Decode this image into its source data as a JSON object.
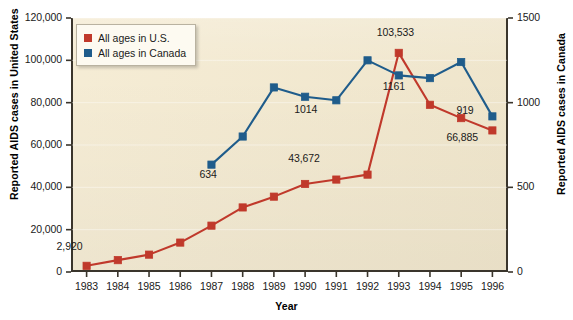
{
  "chart_data": {
    "type": "line",
    "title": "",
    "xlabel": "Year",
    "ylabel": "Reported AIDS cases in United States",
    "ylabel_right": "Reported AIDS cases in Canada",
    "categories": [
      "1983",
      "1984",
      "1985",
      "1986",
      "1987",
      "1988",
      "1989",
      "1990",
      "1991",
      "1992",
      "1993",
      "1994",
      "1995",
      "1996"
    ],
    "x": [
      1983,
      1984,
      1985,
      1986,
      1987,
      1988,
      1989,
      1990,
      1991,
      1992,
      1993,
      1994,
      1995,
      1996
    ],
    "xlim": [
      1982.5,
      1996.5
    ],
    "ylim": [
      0,
      120000
    ],
    "ylim_right": [
      0,
      1500
    ],
    "yticks": [
      "0",
      "20,000",
      "40,000",
      "60,000",
      "80,000",
      "100,000",
      "120,000"
    ],
    "ytick_values": [
      0,
      20000,
      40000,
      60000,
      80000,
      100000,
      120000
    ],
    "yticks_right": [
      "0",
      "500",
      "1000",
      "1500"
    ],
    "ytick_values_right": [
      0,
      500,
      1000,
      1500
    ],
    "grid": false,
    "legend_position": "upper-left",
    "series": [
      {
        "name": "All ages in U.S.",
        "axis": "left",
        "color": "#c0392b",
        "marker": "square",
        "x": [
          1983,
          1984,
          1985,
          1986,
          1987,
          1988,
          1989,
          1990,
          1991,
          1992,
          1993,
          1994,
          1995,
          1996
        ],
        "values": [
          2920,
          5600,
          8200,
          13900,
          21900,
          30500,
          35600,
          41600,
          43672,
          46000,
          103533,
          79000,
          72700,
          66885
        ]
      },
      {
        "name": "All ages in Canada",
        "axis": "right",
        "color": "#1f5c8b",
        "marker": "square",
        "x": [
          1987,
          1988,
          1989,
          1990,
          1991,
          1992,
          1993,
          1994,
          1995,
          1996
        ],
        "values": [
          634,
          800,
          1090,
          1035,
          1014,
          1250,
          1161,
          1145,
          1240,
          919
        ]
      }
    ],
    "annotations": [
      {
        "text": "2,920",
        "series": "All ages in U.S.",
        "x": 1983,
        "value": 2920
      },
      {
        "text": "43,672",
        "series": "All ages in U.S.",
        "x": 1991,
        "value": 43672
      },
      {
        "text": "103,533",
        "series": "All ages in U.S.",
        "x": 1993,
        "value": 103533
      },
      {
        "text": "66,885",
        "series": "All ages in U.S.",
        "x": 1996,
        "value": 66885
      },
      {
        "text": "634",
        "series": "All ages in Canada",
        "x": 1987,
        "value": 634
      },
      {
        "text": "1014",
        "series": "All ages in Canada",
        "x": 1991,
        "value": 1014
      },
      {
        "text": "1161",
        "series": "All ages in Canada",
        "x": 1993,
        "value": 1161
      },
      {
        "text": "919",
        "series": "All ages in Canada",
        "x": 1996,
        "value": 919
      }
    ],
    "colors": {
      "us": "#c0392b",
      "canada": "#1f5c8b",
      "plot_background": "#f4ead0",
      "page_background": "#ffffff",
      "axis": "#3a352c"
    }
  }
}
